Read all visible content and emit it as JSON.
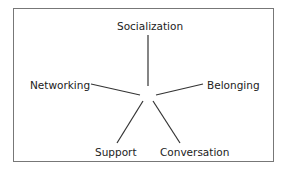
{
  "diagram": {
    "type": "radial-concept",
    "center": "",
    "nodes": [
      {
        "id": "socialization",
        "label": "Socialization"
      },
      {
        "id": "belonging",
        "label": "Belonging"
      },
      {
        "id": "conversation",
        "label": "Conversation"
      },
      {
        "id": "support",
        "label": "Support"
      },
      {
        "id": "networking",
        "label": "Networking"
      }
    ]
  }
}
